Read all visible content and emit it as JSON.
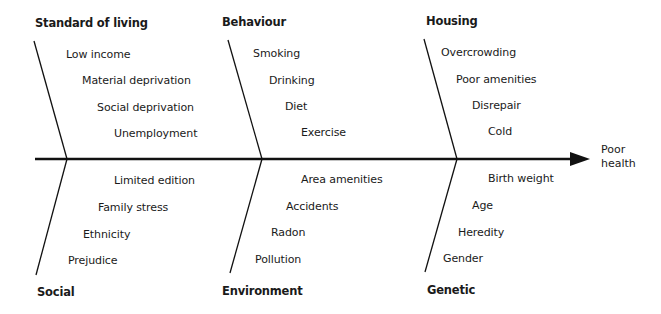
{
  "diagram": {
    "type": "fishbone",
    "outcome": {
      "line1": "Poor",
      "line2": "health"
    },
    "categories": {
      "standard_of_living": {
        "title": "Standard of living",
        "causes": [
          "Low income",
          "Material deprivation",
          "Social deprivation",
          "Unemployment"
        ]
      },
      "behaviour": {
        "title": "Behaviour",
        "causes": [
          "Smoking",
          "Drinking",
          "Diet",
          "Exercise"
        ]
      },
      "housing": {
        "title": "Housing",
        "causes": [
          "Overcrowding",
          "Poor amenities",
          "Disrepair",
          "Cold"
        ]
      },
      "social": {
        "title": "Social",
        "causes": [
          "Limited edition",
          "Family stress",
          "Ethnicity",
          "Prejudice"
        ]
      },
      "environment": {
        "title": "Environment",
        "causes": [
          "Area amenities",
          "Accidents",
          "Radon",
          "Pollution"
        ]
      },
      "genetic": {
        "title": "Genetic",
        "causes": [
          "Birth weight",
          "Age",
          "Heredity",
          "Gender"
        ]
      }
    },
    "colors": {
      "line": "#111111",
      "text": "#1a1a1a",
      "background": "#ffffff"
    }
  }
}
